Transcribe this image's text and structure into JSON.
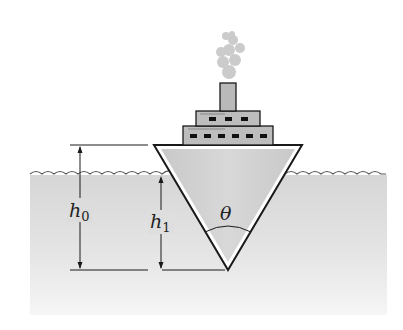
{
  "diagram": {
    "title": "",
    "labels": {
      "h0": "h",
      "h0_sub": "0",
      "h1": "h",
      "h1_sub": "1",
      "theta": "θ"
    },
    "colors": {
      "background": "#ffffff",
      "water_top": "#d9d9d9",
      "water_bottom": "#f4f4f4",
      "hull_fill": "#cfcfcf",
      "outline": "#1a1a1a",
      "smoke": "#c8c8c8",
      "superstructure": "#bdbdbd",
      "windows": "#111111"
    },
    "elements": [
      "water-region",
      "wave-surface",
      "hull-triangle",
      "superstructure-lower",
      "superstructure-upper",
      "smokestack",
      "smoke-cloud",
      "dimension-h0",
      "dimension-h1",
      "angle-theta-arc"
    ]
  }
}
